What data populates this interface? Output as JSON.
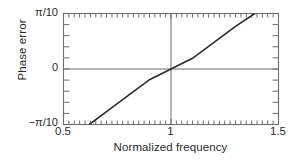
{
  "chart_data": {
    "type": "line",
    "title": "",
    "xlabel": "Normalized frequency",
    "ylabel": "Phase error",
    "xlim": [
      0.5,
      1.5
    ],
    "ylim": [
      -0.3141592653589793,
      0.3141592653589793
    ],
    "ytick_labels": [
      "π/10",
      "0",
      "−π/10"
    ],
    "ytick_values": [
      0.3141592653589793,
      0,
      -0.3141592653589793
    ],
    "xtick_labels": [
      "0.5",
      "1",
      "1.5"
    ],
    "xtick_values": [
      0.5,
      1.0,
      1.5
    ],
    "x_minor_tick_step": 0.025,
    "y_minor_tick_step": 0.0628318530717959,
    "grid": false,
    "legend": null,
    "reference_lines": [
      {
        "name": "zero-phase-error-line",
        "orientation": "horizontal",
        "value": 0
      },
      {
        "name": "unity-frequency-line",
        "orientation": "vertical",
        "value": 1.0
      }
    ],
    "series": [
      {
        "name": "phase error",
        "x": [
          0.62,
          0.7,
          0.8,
          0.9,
          1.0,
          1.1,
          1.2,
          1.3,
          1.39
        ],
        "y": [
          -0.31416,
          -0.24158,
          -0.15099,
          -0.06039,
          0.0,
          0.06039,
          0.15099,
          0.24158,
          0.31416
        ]
      }
    ],
    "line_color": "#2b2b2b",
    "axis_color": "#6e6e6e",
    "background_color": "#ffffff"
  },
  "axis": {
    "ylabel": "Phase error",
    "xlabel": "Normalized frequency",
    "ytick_top": "π/10",
    "ytick_mid": "0",
    "ytick_bottom": "−π/10",
    "xtick_left": "0.5",
    "xtick_mid": "1",
    "xtick_right": "1.5"
  }
}
